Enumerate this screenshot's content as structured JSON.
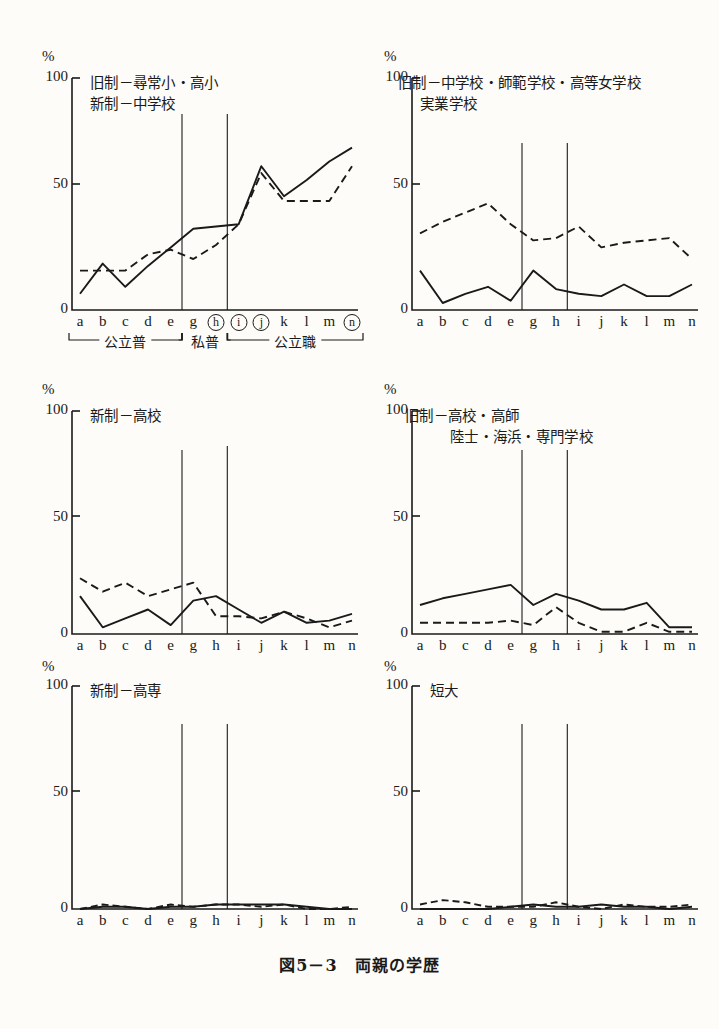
{
  "caption": "図5－3　両親の学歴",
  "axis": {
    "pct_symbol": "%",
    "yticks": [
      "100",
      "50",
      "0"
    ],
    "ylim": [
      0,
      100
    ],
    "categories": [
      "a",
      "b",
      "c",
      "d",
      "e",
      "g",
      "h",
      "i",
      "j",
      "k",
      "l",
      "m",
      "n"
    ],
    "categories_top_left": [
      "a",
      "b",
      "c",
      "d",
      "e",
      "g",
      "h",
      "i",
      "j",
      "k",
      "l",
      "m",
      "n"
    ],
    "circled_top_left": [
      "h",
      "i",
      "j",
      "n"
    ]
  },
  "group_brackets": [
    {
      "label": "公立普",
      "from": "a",
      "to": "e"
    },
    {
      "label": "私普",
      "from": "g",
      "to": "h"
    },
    {
      "label": "公立職",
      "from": "i",
      "to": "n"
    }
  ],
  "panels": [
    {
      "id": "panel-1",
      "title_lines": [
        "旧制－尋常小・高小",
        "新制－中学校"
      ],
      "chart_data": {
        "type": "line",
        "title": "旧制－尋常小・高小 / 新制－中学校",
        "xlabel": "",
        "ylabel": "%",
        "ylim": [
          0,
          100
        ],
        "grid": false,
        "legend": "none",
        "categories": [
          "a",
          "b",
          "c",
          "d",
          "e",
          "g",
          "h",
          "i",
          "j",
          "k",
          "l",
          "m",
          "n"
        ],
        "series": [
          {
            "name": "父（実線）",
            "style": "solid",
            "values": [
              7,
              20,
              10,
              19,
              27,
              35,
              36,
              37,
              62,
              49,
              56,
              64,
              70
            ]
          },
          {
            "name": "母（破線）",
            "style": "dashed",
            "values": [
              17,
              17,
              17,
              24,
              26,
              22,
              28,
              37,
              59,
              47,
              47,
              47,
              62
            ]
          }
        ],
        "dividers_after": [
          "e",
          "h"
        ]
      }
    },
    {
      "id": "panel-2",
      "title_lines": [
        "旧制－中学校・師範学校・高等女学校",
        "実業学校"
      ],
      "chart_data": {
        "type": "line",
        "title": "旧制－中学校・師範学校・高等女学校 / 実業学校",
        "xlabel": "",
        "ylabel": "%",
        "ylim": [
          0,
          100
        ],
        "grid": false,
        "legend": "none",
        "categories": [
          "a",
          "b",
          "c",
          "d",
          "e",
          "g",
          "h",
          "i",
          "j",
          "k",
          "l",
          "m",
          "n"
        ],
        "series": [
          {
            "name": "父（実線）",
            "style": "solid",
            "values": [
              17,
              3,
              7,
              10,
              4,
              17,
              9,
              7,
              6,
              11,
              6,
              6,
              11
            ]
          },
          {
            "name": "母（破線）",
            "style": "dashed",
            "values": [
              33,
              38,
              42,
              46,
              37,
              30,
              31,
              36,
              27,
              29,
              30,
              31,
              22
            ]
          }
        ],
        "dividers_after": [
          "e",
          "h"
        ]
      }
    },
    {
      "id": "panel-3",
      "title_lines": [
        "新制－高校"
      ],
      "chart_data": {
        "type": "line",
        "title": "新制－高校",
        "xlabel": "",
        "ylabel": "%",
        "ylim": [
          0,
          100
        ],
        "grid": false,
        "legend": "none",
        "categories": [
          "a",
          "b",
          "c",
          "d",
          "e",
          "g",
          "h",
          "i",
          "j",
          "k",
          "l",
          "m",
          "n"
        ],
        "series": [
          {
            "name": "父（実線）",
            "style": "solid",
            "values": [
              17,
              3,
              7,
              11,
              4,
              15,
              17,
              11,
              5,
              10,
              5,
              6,
              9
            ]
          },
          {
            "name": "母（破線）",
            "style": "dashed",
            "values": [
              25,
              19,
              23,
              17,
              20,
              23,
              8,
              8,
              7,
              10,
              7,
              3,
              6
            ]
          }
        ],
        "dividers_after": [
          "e",
          "h"
        ]
      }
    },
    {
      "id": "panel-4",
      "title_lines": [
        "旧制－高校・高師",
        "陸士・海浜・専門学校"
      ],
      "chart_data": {
        "type": "line",
        "title": "旧制－高校・高師 / 陸士・海浜・専門学校",
        "xlabel": "",
        "ylabel": "%",
        "ylim": [
          0,
          100
        ],
        "grid": false,
        "legend": "none",
        "categories": [
          "a",
          "b",
          "c",
          "d",
          "e",
          "g",
          "h",
          "i",
          "j",
          "k",
          "l",
          "m",
          "n"
        ],
        "series": [
          {
            "name": "父（実線）",
            "style": "solid",
            "values": [
              13,
              16,
              18,
              20,
              22,
              13,
              18,
              15,
              11,
              11,
              14,
              3,
              3
            ]
          },
          {
            "name": "母（破線）",
            "style": "dashed",
            "values": [
              5,
              5,
              5,
              5,
              6,
              4,
              12,
              5,
              1,
              1,
              5,
              1,
              1
            ]
          }
        ],
        "dividers_after": [
          "e",
          "h"
        ]
      }
    },
    {
      "id": "panel-5",
      "title_lines": [
        "新制－高専"
      ],
      "chart_data": {
        "type": "line",
        "title": "新制－高専",
        "xlabel": "",
        "ylabel": "%",
        "ylim": [
          0,
          100
        ],
        "grid": false,
        "legend": "none",
        "categories": [
          "a",
          "b",
          "c",
          "d",
          "e",
          "g",
          "h",
          "i",
          "j",
          "k",
          "l",
          "m",
          "n"
        ],
        "series": [
          {
            "name": "父（実線）",
            "style": "solid",
            "values": [
              0,
              1,
              1,
              0,
              1,
              1,
              2,
              2,
              2,
              2,
              1,
              0,
              0
            ]
          },
          {
            "name": "母（破線）",
            "style": "dashed",
            "values": [
              0,
              2,
              1,
              0,
              2,
              1,
              2,
              2,
              1,
              2,
              0,
              0,
              1
            ]
          }
        ],
        "dividers_after": [
          "e",
          "h"
        ]
      }
    },
    {
      "id": "panel-6",
      "title_lines": [
        "短大"
      ],
      "chart_data": {
        "type": "line",
        "title": "短大",
        "xlabel": "",
        "ylabel": "%",
        "ylim": [
          0,
          100
        ],
        "grid": false,
        "legend": "none",
        "categories": [
          "a",
          "b",
          "c",
          "d",
          "e",
          "g",
          "h",
          "i",
          "j",
          "k",
          "l",
          "m",
          "n"
        ],
        "series": [
          {
            "name": "父（実線）",
            "style": "solid",
            "values": [
              0,
              0,
              0,
              0,
              1,
              2,
              1,
              1,
              2,
              1,
              1,
              0,
              1
            ]
          },
          {
            "name": "母（破線）",
            "style": "dashed",
            "values": [
              2,
              4,
              3,
              1,
              1,
              1,
              3,
              1,
              0,
              2,
              1,
              1,
              2
            ]
          }
        ],
        "dividers_after": [
          "e",
          "h"
        ]
      }
    }
  ]
}
